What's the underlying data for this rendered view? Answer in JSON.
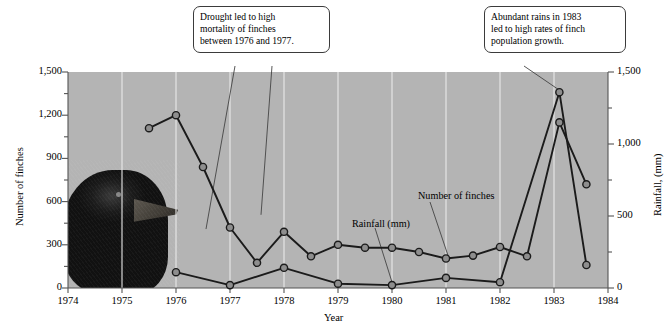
{
  "chart_data": {
    "type": "line",
    "title": "",
    "xlabel": "Year",
    "ylabel": "Number of finches",
    "y2label": "Rainfall, (mm)",
    "xlim": [
      1974,
      1984
    ],
    "ylim": [
      0,
      1500
    ],
    "y2lim": [
      0,
      1500
    ],
    "grid": true,
    "legend_position": "inline-annotations",
    "x_ticks": [
      "1974",
      "1975",
      "1976",
      "1977",
      "1978",
      "1979",
      "1980",
      "1981",
      "1982",
      "1983",
      "1984"
    ],
    "y_ticks_left": [
      "0",
      "300",
      "600",
      "900",
      "1,200",
      "1,500"
    ],
    "y_ticks_right": [
      "0",
      "500",
      "1,000",
      "1,500"
    ],
    "series": [
      {
        "name": "Number of finches",
        "axis": "left",
        "x": [
          1975.5,
          1976.0,
          1976.5,
          1977.0,
          1977.5,
          1978.0,
          1978.5,
          1979.0,
          1979.5,
          1980.0,
          1980.5,
          1981.0,
          1981.5,
          1982.0,
          1982.5,
          1983.1,
          1983.6
        ],
        "values": [
          1110,
          1200,
          840,
          420,
          175,
          390,
          220,
          300,
          280,
          280,
          250,
          205,
          225,
          285,
          220,
          1150,
          720
        ]
      },
      {
        "name": "Rainfall (mm)",
        "axis": "right",
        "x": [
          1976.0,
          1977.0,
          1978.0,
          1979.0,
          1980.0,
          1981.0,
          1982.0,
          1983.1,
          1983.6
        ],
        "values": [
          110,
          20,
          140,
          30,
          20,
          70,
          40,
          1360,
          160
        ]
      }
    ],
    "annotations": [
      {
        "id": "drought-callout",
        "text": "Drought led to high mortality of finches between 1976 and 1977.",
        "lines": [
          "Drought led to high",
          "mortality of finches",
          "between 1976 and 1977."
        ],
        "points_to": [
          "1976.5 finches",
          "1977.5 finches"
        ]
      },
      {
        "id": "rains-callout",
        "text": "Abundant rains in 1983 led to high rates of finch population growth.",
        "lines": [
          "Abundant rains in 1983",
          "led to high rates of finch",
          "population growth."
        ],
        "points_to": [
          "1983 rainfall peak"
        ]
      },
      {
        "id": "rainfall-series-label",
        "text": "Rainfall (mm)",
        "points_to": "1980 rainfall"
      },
      {
        "id": "finches-series-label",
        "text": "Number of finches",
        "points_to": "1981 finches"
      }
    ],
    "image_overlay": {
      "name": "finch-photo",
      "description": "photograph of a Darwin's finch head"
    },
    "colors": {
      "plot_background": "#b4b4b4",
      "gridline": "#e9e9e9",
      "series_line": "#1b1b1b",
      "marker_fill": "#8e8e8e",
      "axis": "#555555",
      "callout_border": "#3b3b3b",
      "page_background": "#ffffff"
    }
  }
}
